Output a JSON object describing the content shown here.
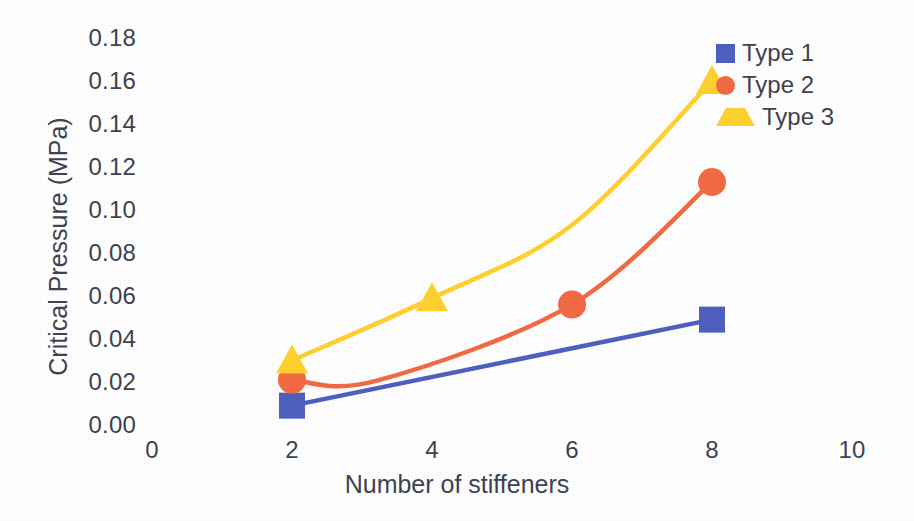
{
  "chart_data": {
    "type": "line",
    "title": "",
    "xlabel": "Number of stiffeners",
    "ylabel": "Critical Pressure (MPa)",
    "xlim": [
      0,
      10
    ],
    "ylim": [
      0.0,
      0.18
    ],
    "xticks": [
      "0",
      "2",
      "4",
      "6",
      "8",
      "10"
    ],
    "yticks": [
      "0.18",
      "0.16",
      "0.14",
      "0.12",
      "0.10",
      "0.08",
      "0.06",
      "0.04",
      "0.02",
      "0.00"
    ],
    "grid": false,
    "legend_position": "top-right",
    "series": [
      {
        "name": "Type 1",
        "marker": "square",
        "color": "#4e5fbd",
        "x": [
          2,
          8
        ],
        "values": [
          0.009,
          0.049
        ]
      },
      {
        "name": "Type 2",
        "marker": "circle",
        "color": "#f16a43",
        "x": [
          2,
          6,
          8
        ],
        "values": [
          0.021,
          0.056,
          0.113
        ]
      },
      {
        "name": "Type 3",
        "marker": "triangle",
        "color": "#ffd02e",
        "x": [
          2,
          4,
          8
        ],
        "values": [
          0.03,
          0.059,
          0.16
        ]
      }
    ]
  },
  "legend": {
    "items": [
      {
        "label": "Type 1",
        "marker": "square-marker",
        "color": "#4e5fbd"
      },
      {
        "label": "Type 2",
        "marker": "circle-marker",
        "color": "#f16a43"
      },
      {
        "label": "Type 3",
        "marker": "triangle-marker",
        "color": "#ffd02e"
      }
    ]
  },
  "axes": {
    "y_title": "Critical Pressure (MPa)",
    "x_title": "Number of stiffeners"
  }
}
